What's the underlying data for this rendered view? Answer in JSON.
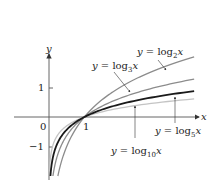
{
  "chart_data": {
    "type": "line",
    "title": "",
    "xlabel": "x",
    "ylabel": "y",
    "xlim": [
      0,
      4.1
    ],
    "ylim": [
      -2,
      2.1
    ],
    "grid": false,
    "legend": "inline annotations with arrows",
    "x_ticks": [
      {
        "value": 1,
        "label": "1"
      }
    ],
    "y_ticks": [
      {
        "value": 1,
        "label": "1"
      },
      {
        "value": -1,
        "label": "−1"
      }
    ],
    "origin_label": "0",
    "series": [
      {
        "name": "y = log_2 x",
        "base": 2,
        "color": "#8c8c8c",
        "width": 1.3,
        "x": [
          0.25,
          0.5,
          1,
          2,
          3,
          4
        ],
        "values": [
          -2,
          -1,
          0,
          1,
          1.585,
          2
        ]
      },
      {
        "name": "y = log_3 x",
        "base": 3,
        "color": "#8c8c8c",
        "width": 1.3,
        "x": [
          0.25,
          0.5,
          1,
          2,
          3,
          4
        ],
        "values": [
          -1.262,
          -0.631,
          0,
          0.631,
          1,
          1.262
        ]
      },
      {
        "name": "y = log_5 x",
        "base": 5,
        "color": "#1a1a1a",
        "width": 1.8,
        "x": [
          0.25,
          0.5,
          1,
          2,
          3,
          4
        ],
        "values": [
          -0.861,
          -0.431,
          0,
          0.431,
          0.683,
          0.861
        ]
      },
      {
        "name": "y = log_10 x",
        "base": 10,
        "color": "#c4c4c4",
        "width": 1.3,
        "x": [
          0.25,
          0.5,
          1,
          2,
          3,
          4
        ],
        "values": [
          -0.602,
          -0.301,
          0,
          0.301,
          0.477,
          0.602
        ]
      }
    ],
    "annotations": [
      {
        "series": "log2",
        "text_prefix": "y = log",
        "sub": "2",
        "var": "x"
      },
      {
        "series": "log3",
        "text_prefix": "y = log",
        "sub": "3",
        "var": "x"
      },
      {
        "series": "log5",
        "text_prefix": "y = log",
        "sub": "5",
        "var": "x"
      },
      {
        "series": "log10",
        "text_prefix": "y = log",
        "sub": "10",
        "var": "x"
      }
    ]
  },
  "labels": {
    "x_axis": "x",
    "y_axis": "y",
    "origin": "0",
    "tick_x1": "1",
    "tick_y1": "1",
    "tick_ym1": "−1",
    "log2": {
      "prefix": "y = log",
      "sub": "2",
      "var": "x"
    },
    "log3": {
      "prefix": "y = log",
      "sub": "3",
      "var": "x"
    },
    "log5": {
      "prefix": "y = log",
      "sub": "5",
      "var": "x"
    },
    "log10": {
      "prefix": "y = log",
      "sub": "10",
      "var": "x"
    }
  }
}
